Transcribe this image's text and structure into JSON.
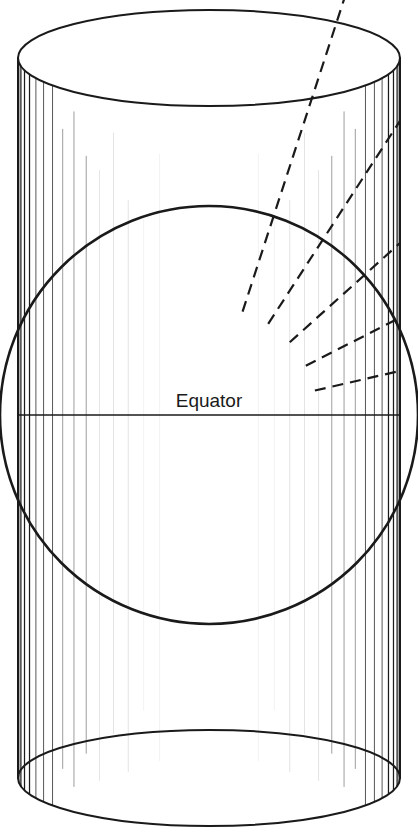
{
  "figure": {
    "labels": {
      "equator": "Equator"
    },
    "colors": {
      "background": "#ffffff",
      "outline": "#1a1a1a",
      "meridian": "#3a3a3a",
      "meridian_faint": "#8a8a8a",
      "ray": "#1a1a1a",
      "text": "#1a1a1a"
    },
    "canvas": {
      "width": 418,
      "height": 834
    },
    "cylinder": {
      "left_x": 18,
      "right_x": 400,
      "top_y": 30,
      "bottom_y": 806,
      "ellipse_rx": 191,
      "ellipse_ry": 48,
      "top_ellipse_cy": 58,
      "bottom_ellipse_cy": 778,
      "stroke_width": 2
    },
    "sphere": {
      "center_x": 209,
      "center_y": 415,
      "radius": 209,
      "stroke_width": 2.6
    },
    "equator_line": {
      "y": 415,
      "x1": 18,
      "x2": 400,
      "stroke_width": 1.6,
      "label_x": 209,
      "label_y": 407
    },
    "meridians": {
      "description": "Vertical meridian lines on the cylinder surface, spaced by cos(longitude) so they bunch toward the silhouette edges",
      "count": 36,
      "top_y": 70,
      "bottom_y": 790
    },
    "projection_rays": {
      "description": "Dashed rays from the sphere centre through the surface out to the cylinder wall",
      "dash_pattern": "11 7",
      "stroke_width": 2.2,
      "angles_deg": [
        72,
        57,
        42,
        27,
        13
      ],
      "end_x": 400
    }
  },
  "chart_data": {
    "type": "diagram",
    "annotations": [
      "Equator"
    ],
    "elements": [
      "cylinder (open at top and bottom)",
      "inscribed sphere / globe",
      "equator line at mid-height",
      "meridian lines on cylinder",
      "dashed projection rays from globe centre to cylinder"
    ]
  }
}
